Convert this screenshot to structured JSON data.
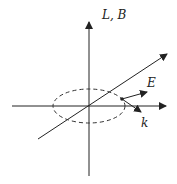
{
  "diagram": {
    "labels": {
      "vertical_axis": "L, B",
      "electric_field": "E",
      "wave_vector": "k"
    },
    "colors": {
      "stroke": "#222222",
      "background": "#ffffff"
    }
  }
}
